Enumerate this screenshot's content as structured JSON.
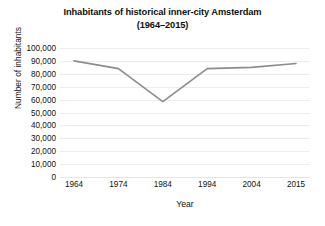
{
  "chart_data": {
    "type": "line",
    "title": "Inhabitants of historical inner-city Amsterdam (1964–2015)",
    "title_lines": [
      "Inhabitants of historical inner-city Amsterdam",
      "(1964–2015)"
    ],
    "xlabel": "Year",
    "ylabel": "Number of inhabitants",
    "categories": [
      "1964",
      "1974",
      "1984",
      "1994",
      "2004",
      "2015"
    ],
    "x": [
      1964,
      1974,
      1984,
      1994,
      2004,
      2015
    ],
    "values": [
      90000,
      84000,
      58500,
      84000,
      85000,
      88000
    ],
    "series": [
      {
        "name": "Inhabitants",
        "values": [
          90000,
          84000,
          58500,
          84000,
          85000,
          88000
        ],
        "color": "#8c8c8c"
      }
    ],
    "ylim": [
      0,
      100000
    ],
    "ytick_values": [
      0,
      10000,
      20000,
      30000,
      40000,
      50000,
      60000,
      70000,
      80000,
      90000,
      100000
    ],
    "ytick_labels": [
      "0",
      "10,000",
      "20,000",
      "30,000",
      "40,000",
      "50,000",
      "60,000",
      "70,000",
      "80,000",
      "90,000",
      "100,000"
    ],
    "xtick_labels": [
      "1964",
      "1974",
      "1984",
      "1994",
      "2004",
      "2015"
    ],
    "grid": "horizontal",
    "gridline_color": "#ededed",
    "legend": "none",
    "markers": "none",
    "background_color": "#ffffff",
    "line_color": "#8c8c8c",
    "line_width": 1.6
  }
}
